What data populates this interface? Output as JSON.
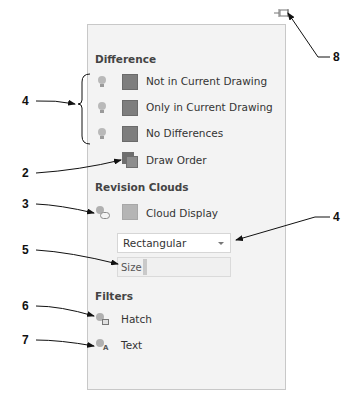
{
  "panel": {
    "sections": {
      "difference": {
        "title": "Difference",
        "items": [
          {
            "label": "Not in Current Drawing",
            "color": "#7d7d7d"
          },
          {
            "label": "Only in Current Drawing",
            "color": "#7d7d7d"
          },
          {
            "label": "No Differences",
            "color": "#7d7d7d"
          }
        ],
        "draw_order": {
          "label": "Draw Order"
        }
      },
      "revision_clouds": {
        "title": "Revision Clouds",
        "cloud_display": {
          "label": "Cloud Display",
          "color": "#b5b5b5"
        },
        "shape_dropdown": {
          "value": "Rectangular"
        },
        "size_field": {
          "label": "Size"
        }
      },
      "filters": {
        "title": "Filters",
        "items": [
          {
            "label": "Hatch",
            "icon": "hatch-filter-icon"
          },
          {
            "label": "Text",
            "icon": "text-filter-icon"
          }
        ]
      }
    },
    "pin_icon": "pin-icon"
  },
  "callouts": [
    {
      "number": "8",
      "target": "pin-icon"
    },
    {
      "number": "4",
      "target": "difference-items"
    },
    {
      "number": "2",
      "target": "draw-order"
    },
    {
      "number": "3",
      "target": "cloud-display-toggle"
    },
    {
      "number": "4",
      "target": "shape-dropdown"
    },
    {
      "number": "5",
      "target": "size-slider"
    },
    {
      "number": "6",
      "target": "hatch-filter"
    },
    {
      "number": "7",
      "target": "text-filter"
    }
  ]
}
